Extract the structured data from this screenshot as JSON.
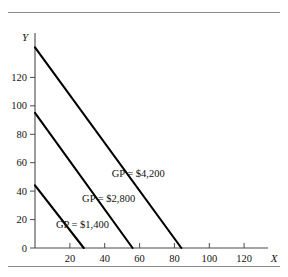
{
  "figure": {
    "title": "",
    "top_rule": "horizontal-rule",
    "bottom_rule": "horizontal-rule"
  },
  "axes": {
    "x_name": "X",
    "y_name": "Y",
    "x_ticks": [
      "20",
      "40",
      "60",
      "80",
      "100",
      "120"
    ],
    "y_ticks": [
      "0",
      "20",
      "40",
      "60",
      "80",
      "100",
      "120"
    ]
  },
  "labels": {
    "line_1": "GP = $1,400",
    "line_2": "GP = $2,800",
    "line_3": "GP = $4,200"
  },
  "colors": {
    "line": "#000000",
    "axis": "#4a4a4a",
    "rule": "#8a8a8a",
    "text": "#111111",
    "background": "#ffffff"
  },
  "chart_data": {
    "type": "line",
    "title": "",
    "xlabel": "X",
    "ylabel": "Y",
    "xlim": [
      0,
      134
    ],
    "ylim": [
      0,
      148
    ],
    "grid": false,
    "legend": "inline-annotations",
    "x_ticks": [
      20,
      40,
      60,
      80,
      100,
      120
    ],
    "y_ticks": [
      0,
      20,
      40,
      60,
      80,
      100,
      120
    ],
    "series": [
      {
        "name": "GP = $1,400",
        "label": "GP = $1,400",
        "x": [
          0,
          28
        ],
        "y": [
          44,
          0
        ],
        "y_intercept": 44,
        "x_intercept": 28,
        "annotation_x": 12,
        "annotation_y": 14
      },
      {
        "name": "GP = $2,800",
        "label": "GP = $2,800",
        "x": [
          0,
          56
        ],
        "y": [
          95,
          0
        ],
        "y_intercept": 95,
        "x_intercept": 56,
        "annotation_x": 27,
        "annotation_y": 32
      },
      {
        "name": "GP = $4,200",
        "label": "GP = $4,200",
        "x": [
          0,
          84
        ],
        "y": [
          141,
          0
        ],
        "y_intercept": 141,
        "x_intercept": 84,
        "annotation_x": 44,
        "annotation_y": 50
      }
    ]
  }
}
